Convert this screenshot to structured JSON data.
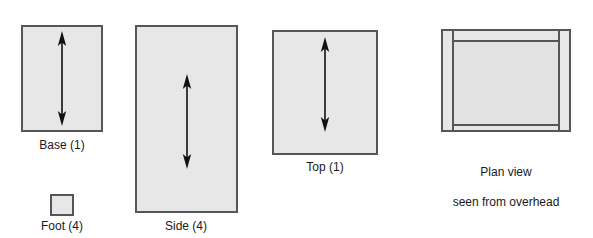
{
  "diagram": {
    "background_color": "#ffffff",
    "panel_fill": "#e7e7e7",
    "panel_stroke": "#565656",
    "arrow_color": "#111111",
    "text_color": "#1a1a1a"
  },
  "parts": [
    {
      "id": "base",
      "label": "Base (1)",
      "quantity": 1,
      "shape": "rectangle",
      "has_arrow": true,
      "arrow_type": "double-headed-vertical"
    },
    {
      "id": "side",
      "label": "Side (4)",
      "quantity": 4,
      "shape": "rectangle",
      "has_arrow": true,
      "arrow_type": "double-headed-vertical"
    },
    {
      "id": "top",
      "label": "Top (1)",
      "quantity": 1,
      "shape": "rectangle",
      "has_arrow": true,
      "arrow_type": "double-headed-vertical"
    },
    {
      "id": "foot",
      "label": "Foot (4)",
      "quantity": 4,
      "shape": "square",
      "has_arrow": false,
      "arrow_type": ""
    }
  ],
  "plan_view": {
    "caption_line1": "Plan view",
    "caption_line2": "seen from overhead",
    "caption": "Plan view\nseen from overhead"
  }
}
